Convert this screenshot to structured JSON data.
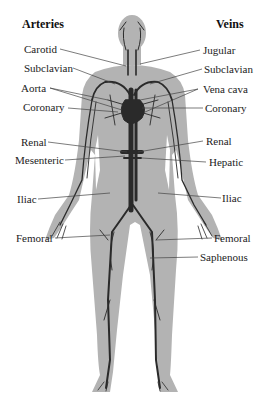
{
  "diagram": {
    "colors": {
      "body_fill": "#b3b3b3",
      "vessel": "#2a2a2a",
      "leader_line": "#444444",
      "background": "#ffffff"
    },
    "left_column": {
      "heading": "Arteries",
      "labels": [
        {
          "id": "carotid",
          "text": "Carotid"
        },
        {
          "id": "subclavian-artery",
          "text": "Subclavian"
        },
        {
          "id": "aorta",
          "text": "Aorta"
        },
        {
          "id": "coronary-artery",
          "text": "Coronary"
        },
        {
          "id": "renal-artery",
          "text": "Renal"
        },
        {
          "id": "mesenteric",
          "text": "Mesenteric"
        },
        {
          "id": "iliac-artery",
          "text": "Iliac"
        },
        {
          "id": "femoral-artery",
          "text": "Femoral"
        }
      ]
    },
    "right_column": {
      "heading": "Veins",
      "labels": [
        {
          "id": "jugular",
          "text": "Jugular"
        },
        {
          "id": "subclavian-vein",
          "text": "Subclavian"
        },
        {
          "id": "vena-cava",
          "text": "Vena cava"
        },
        {
          "id": "coronary-vein",
          "text": "Coronary"
        },
        {
          "id": "renal-vein",
          "text": "Renal"
        },
        {
          "id": "hepatic",
          "text": "Hepatic"
        },
        {
          "id": "iliac-vein",
          "text": "Iliac"
        },
        {
          "id": "femoral-vein",
          "text": "Femoral"
        },
        {
          "id": "saphenous",
          "text": "Saphenous"
        }
      ]
    }
  }
}
